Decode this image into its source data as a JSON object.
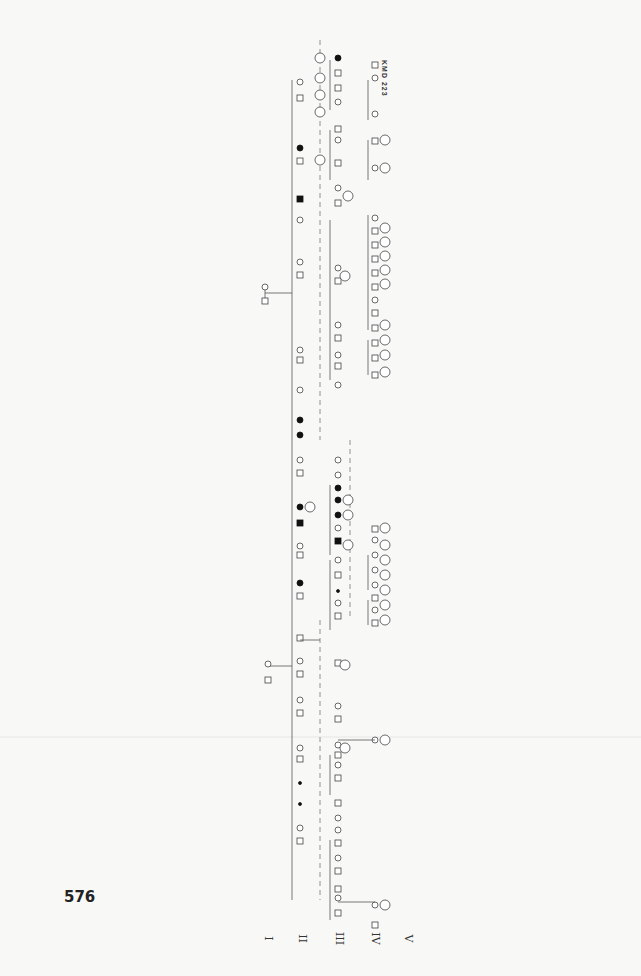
{
  "page": {
    "number": "576",
    "pedigree_id": "KMD 223",
    "orientation": "rotated 90° clockwise"
  },
  "generations": [
    "I",
    "II",
    "III",
    "IV",
    "V"
  ],
  "legend_symbols": {
    "square": "male",
    "circle": "female",
    "filled": "affected",
    "slash_square": "deceased male",
    "diamond": "sex unspecified",
    "circled_number": "age / sibship count marker"
  },
  "founders": [
    {
      "id": "1-2",
      "label": "I-1 / I-2 couple (left branch)"
    },
    {
      "id": "3-4",
      "label": "I-3 / I-4 couple (right branch)"
    }
  ],
  "colors": {
    "line": "#555555",
    "affected": "#111111",
    "background": "#f8f8f6"
  }
}
